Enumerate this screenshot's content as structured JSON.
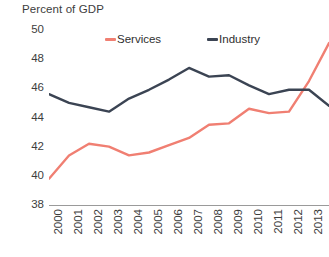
{
  "chart_data": {
    "type": "line",
    "title": "Percent of GDP",
    "xlabel": "",
    "ylabel": "",
    "ylim": [
      38,
      50
    ],
    "ytick_step": 2,
    "yticks": [
      50,
      48,
      46,
      44,
      42,
      40,
      38
    ],
    "grid": false,
    "legend_position": "top-center",
    "categories": [
      "2000",
      "2001",
      "2002",
      "2003",
      "2004",
      "2005",
      "2006",
      "2007",
      "2008",
      "2009",
      "2010",
      "2011",
      "2012",
      "2013",
      "2014"
    ],
    "series": [
      {
        "name": "Services",
        "color": "#F07F72",
        "values": [
          39.8,
          41.4,
          42.2,
          42.0,
          41.4,
          41.6,
          42.1,
          42.6,
          43.5,
          43.6,
          44.6,
          44.3,
          44.4,
          46.5,
          49.1
        ]
      },
      {
        "name": "Industry",
        "color": "#3B4453",
        "values": [
          45.6,
          45.0,
          44.7,
          44.4,
          45.3,
          45.9,
          46.6,
          47.4,
          46.8,
          46.9,
          46.2,
          45.6,
          45.9,
          45.9,
          44.8
        ]
      }
    ]
  },
  "axes": {
    "y_labels": [
      "50",
      "48",
      "46",
      "44",
      "42",
      "40",
      "38"
    ],
    "x_labels": [
      "2000",
      "2001",
      "2002",
      "2003",
      "2004",
      "2005",
      "2006",
      "2007",
      "2008",
      "2009",
      "2010",
      "2011",
      "2012",
      "2013",
      "2014"
    ]
  },
  "legend": {
    "items": [
      {
        "label": "Services",
        "color": "#F07F72"
      },
      {
        "label": "Industry",
        "color": "#3B4453"
      }
    ]
  },
  "title": "Percent of GDP"
}
